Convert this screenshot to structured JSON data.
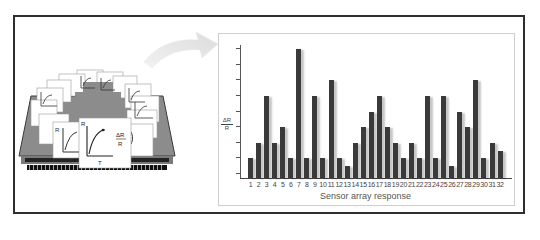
{
  "figure": {
    "caption_left": "Sensor array chip with individual R vs T response curves",
    "sensor_card_labels": {
      "r_axis": "R",
      "t_axis": "T",
      "delta_r": "ΔR",
      "r": "R"
    }
  },
  "chart_data": {
    "type": "bar",
    "title": "",
    "xlabel": "Sensor array response",
    "ylabel": "ΔR / R",
    "categories": [
      "1",
      "2",
      "3",
      "4",
      "5",
      "6",
      "7",
      "8",
      "9",
      "10",
      "11",
      "12",
      "13",
      "14",
      "15",
      "16",
      "17",
      "18",
      "19",
      "20",
      "21",
      "22",
      "23",
      "24",
      "25",
      "26",
      "27",
      "28",
      "29",
      "30",
      "31",
      "32"
    ],
    "values": [
      1,
      2,
      5,
      2,
      3,
      1,
      8,
      1,
      5,
      1,
      6,
      1,
      0.5,
      2,
      3,
      4,
      5,
      3,
      2,
      1,
      2,
      1,
      5,
      1,
      5,
      0.5,
      4,
      3,
      6,
      1,
      2,
      1.5
    ],
    "ylim": [
      0,
      8.3
    ],
    "yticks_count": 9,
    "grid": false,
    "legend": "none",
    "bar_color": "#3a3a3a"
  },
  "colors": {
    "frame": "#2e2e2e",
    "panel_border": "#cfcfcf",
    "bar": "#3a3a3a",
    "chip_gray": "#8a8a8a",
    "arrow": "#e6e6e6"
  }
}
